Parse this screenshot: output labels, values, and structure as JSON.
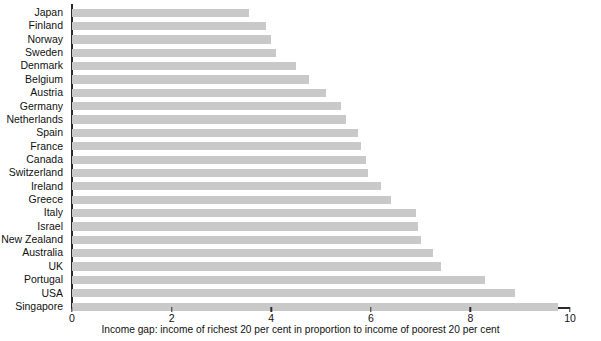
{
  "chart_data": {
    "type": "bar",
    "orientation": "horizontal",
    "title": "",
    "subtitle": "",
    "xlabel": "Income gap: income of richest 20 per cent in proportion to income of poorest 20 per cent",
    "ylabel": "",
    "xlim": [
      0,
      10
    ],
    "xticks": [
      0,
      2,
      4,
      6,
      8,
      10
    ],
    "xtick_labels": [
      "0",
      "2",
      "4",
      "6",
      "8",
      "10"
    ],
    "grid": false,
    "legend": null,
    "bar_color": "#c9c9c9",
    "axis_color": "#2b2b2b",
    "categories": [
      "Japan",
      "Finland",
      "Norway",
      "Sweden",
      "Denmark",
      "Belgium",
      "Austria",
      "Germany",
      "Netherlands",
      "Spain",
      "France",
      "Canada",
      "Switzerland",
      "Ireland",
      "Greece",
      "Italy",
      "Israel",
      "New Zealand",
      "Australia",
      "UK",
      "Portugal",
      "USA",
      "Singapore"
    ],
    "values": [
      3.55,
      3.9,
      4.0,
      4.1,
      4.5,
      4.75,
      5.1,
      5.4,
      5.5,
      5.75,
      5.8,
      5.9,
      5.95,
      6.2,
      6.4,
      6.9,
      6.95,
      7.0,
      7.25,
      7.4,
      8.3,
      8.9,
      9.75
    ]
  }
}
